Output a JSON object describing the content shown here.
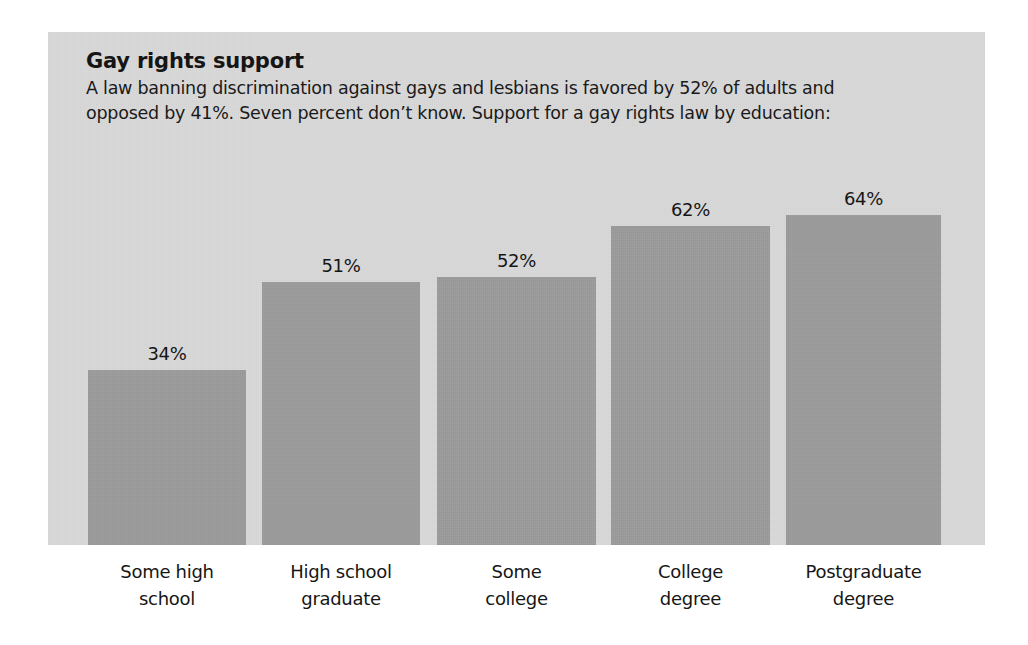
{
  "chart_data": {
    "type": "bar",
    "title": "Gay rights support",
    "subtitle": "A law banning discrimination against gays and lesbians is favored by 52% of adults and\nopposed by 41%. Seven percent don’t know. Support for a gay rights law by education:",
    "categories": [
      "Some high\nschool",
      "High school\ngraduate",
      "Some\ncollege",
      "College\ndegree",
      "Postgraduate\ndegree"
    ],
    "values": [
      34,
      51,
      52,
      62,
      64
    ],
    "value_labels": [
      "34%",
      "51%",
      "52%",
      "62%",
      "64%"
    ],
    "xlabel": "",
    "ylabel": "",
    "ylim": [
      0,
      100
    ],
    "grid": false,
    "legend": false,
    "series_name": "Support for a gay rights law",
    "unit": "%",
    "colors": {
      "bar": "#9b9b9b",
      "panel_background": "#d9d9d9",
      "page_background": "#ffffff",
      "text": "#151515"
    },
    "inline_statistics": {
      "favored_percent": "52%",
      "opposed_percent": "41%",
      "dont_know_percent": "Seven percent"
    }
  }
}
